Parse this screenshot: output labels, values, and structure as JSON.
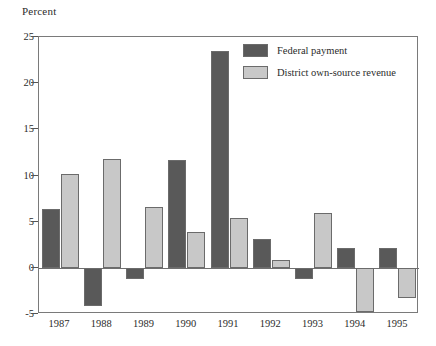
{
  "axis_title": "Percent",
  "legend": {
    "position": "inside-top-right",
    "entries": [
      {
        "label": "Federal payment",
        "color": "#595959",
        "key": "federal"
      },
      {
        "label": "District own-source revenue",
        "color": "#c8c8c8",
        "key": "district"
      }
    ]
  },
  "axes": {
    "y_ticks": [
      "25",
      "20",
      "15",
      "10",
      "5",
      "0",
      "-5"
    ],
    "x_ticks": [
      "1987",
      "1988",
      "1989",
      "1990",
      "1991",
      "1992",
      "1993",
      "1994",
      "1995"
    ]
  },
  "chart_data": {
    "type": "bar",
    "title": "",
    "subtitle": "",
    "xlabel": "",
    "ylabel": "Percent",
    "ylim": [
      -5,
      25
    ],
    "ytick_values": [
      25,
      20,
      15,
      10,
      5,
      0,
      -5
    ],
    "grid": false,
    "legend_position": "inside-top-right",
    "categories": [
      "1987",
      "1988",
      "1989",
      "1990",
      "1991",
      "1992",
      "1993",
      "1994",
      "1995"
    ],
    "series": [
      {
        "name": "Federal payment",
        "color": "#595959",
        "values": [
          6.4,
          -4.1,
          -1.2,
          11.7,
          23.5,
          3.1,
          -1.2,
          2.1,
          2.1
        ]
      },
      {
        "name": "District own-source revenue",
        "color": "#c8c8c8",
        "values": [
          10.2,
          11.8,
          6.6,
          3.9,
          5.4,
          0.8,
          5.9,
          -4.8,
          -3.3
        ]
      }
    ],
    "annotations": []
  }
}
